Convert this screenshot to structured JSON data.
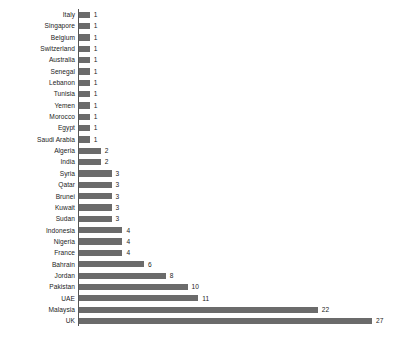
{
  "chart_data": {
    "type": "bar",
    "orientation": "horizontal",
    "title": "",
    "subtitle": "",
    "xlabel": "",
    "ylabel": "",
    "xlim": [
      0,
      27
    ],
    "grid": false,
    "legend": null,
    "bar_color": "#6b6b6b",
    "axis_color": "#555555",
    "text_color": "#1c1c1c",
    "background": "#ffffff",
    "show_value_labels": true,
    "sorted": "ascending",
    "categories": [
      "Italy",
      "Singapore",
      "Belgium",
      "Switzerland",
      "Australia",
      "Senegal",
      "Lebanon",
      "Tunisia",
      "Yemen",
      "Morocco",
      "Egypt",
      "Saudi Arabia",
      "Algeria",
      "India",
      "Syria",
      "Qatar",
      "Brunei",
      "Kuwait",
      "Sudan",
      "Indonesia",
      "Nigeria",
      "France",
      "Bahrain",
      "Jordan",
      "Pakistan",
      "UAE",
      "Malaysia",
      "UK"
    ],
    "values": [
      1,
      1,
      1,
      1,
      1,
      1,
      1,
      1,
      1,
      1,
      1,
      1,
      2,
      2,
      3,
      3,
      3,
      3,
      3,
      4,
      4,
      4,
      6,
      8,
      10,
      11,
      22,
      27
    ],
    "value_labels": [
      "1",
      "1",
      "1",
      "1",
      "1",
      "1",
      "1",
      "1",
      "1",
      "1",
      "1",
      "1",
      "2",
      "2",
      "3",
      "3",
      "3",
      "3",
      "3",
      "4",
      "4",
      "4",
      "6",
      "8",
      "10",
      "11",
      "22",
      "27"
    ]
  }
}
